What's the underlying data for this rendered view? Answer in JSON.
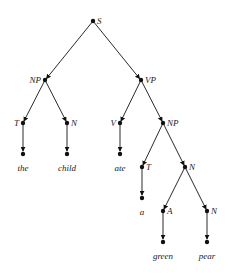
{
  "diagram": {
    "type": "parse-tree",
    "sentence": "the child ate a green pear",
    "nodes": [
      {
        "id": "S",
        "label": "S",
        "x": 93,
        "y": 21,
        "label_side": "right"
      },
      {
        "id": "NP1",
        "label": "NP",
        "x": 45,
        "y": 80,
        "label_side": "left"
      },
      {
        "id": "VP",
        "label": "VP",
        "x": 141,
        "y": 80,
        "label_side": "right"
      },
      {
        "id": "T1",
        "label": "T",
        "x": 23,
        "y": 123,
        "label_side": "left"
      },
      {
        "id": "N1",
        "label": "N",
        "x": 67,
        "y": 123,
        "label_side": "right"
      },
      {
        "id": "V",
        "label": "V",
        "x": 120,
        "y": 123,
        "label_side": "left"
      },
      {
        "id": "NP2",
        "label": "NP",
        "x": 163,
        "y": 123,
        "label_side": "right"
      },
      {
        "id": "T2",
        "label": "T",
        "x": 142,
        "y": 167,
        "label_side": "right"
      },
      {
        "id": "N2",
        "label": "N",
        "x": 185,
        "y": 167,
        "label_side": "right"
      },
      {
        "id": "A",
        "label": "A",
        "x": 163,
        "y": 211,
        "label_side": "right"
      },
      {
        "id": "N3",
        "label": "N",
        "x": 207,
        "y": 211,
        "label_side": "right"
      }
    ],
    "leaves": [
      {
        "parent": "T1",
        "word": "the",
        "x": 23,
        "y": 153
      },
      {
        "parent": "N1",
        "word": "child",
        "x": 67,
        "y": 153
      },
      {
        "parent": "V",
        "word": "ate",
        "x": 120,
        "y": 153
      },
      {
        "parent": "T2",
        "word": "a",
        "x": 142,
        "y": 197
      },
      {
        "parent": "A",
        "word": "green",
        "x": 163,
        "y": 241
      },
      {
        "parent": "N3",
        "word": "pear",
        "x": 207,
        "y": 241
      }
    ],
    "edges": [
      [
        "S",
        "NP1"
      ],
      [
        "S",
        "VP"
      ],
      [
        "NP1",
        "T1"
      ],
      [
        "NP1",
        "N1"
      ],
      [
        "VP",
        "V"
      ],
      [
        "VP",
        "NP2"
      ],
      [
        "NP2",
        "T2"
      ],
      [
        "NP2",
        "N2"
      ],
      [
        "N2",
        "A"
      ],
      [
        "N2",
        "N3"
      ]
    ]
  },
  "labels": {
    "S": "S",
    "NP1": "NP",
    "VP": "VP",
    "T1": "T",
    "N1": "N",
    "V": "V",
    "NP2": "NP",
    "T2": "T",
    "N2": "N",
    "A": "A",
    "N3": "N"
  },
  "words": {
    "the": "the",
    "child": "child",
    "ate": "ate",
    "a": "a",
    "green": "green",
    "pear": "pear"
  }
}
